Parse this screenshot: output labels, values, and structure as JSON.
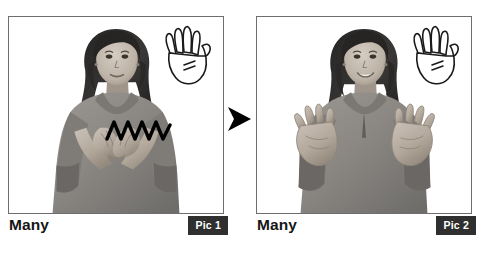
{
  "figure": {
    "type": "sign-language-instruction",
    "sign_word": "Many",
    "background_color": "#ffffff",
    "panel_border_color": "#6e6e6e",
    "badge_background_color": "#2f2f2f",
    "badge_text_color": "#ffffff",
    "caption_text_color": "#161616",
    "arrow_color": "#000000",
    "motion_line_color": "#000000"
  },
  "panels": [
    {
      "id": "pic-1",
      "caption": "Many",
      "badge_label": "Pic 1",
      "photo_alt": "Woman in gray sweater with both hands closed together in front of chest, palms up",
      "hand_diagram_alt": "Line drawing of an open hand with five fingers spread and motion marks",
      "motion_indicator": "zigzag",
      "stage": "start"
    },
    {
      "id": "pic-2",
      "caption": "Many",
      "badge_label": "Pic 2",
      "photo_alt": "Woman in gray sweater with both hands open, fingers spread, moved apart to the sides",
      "hand_diagram_alt": "Line drawing of an open hand with five fingers spread and motion marks",
      "motion_indicator": "none",
      "stage": "end"
    }
  ],
  "transition": {
    "icon": "right-arrow-icon",
    "direction": "right",
    "meaning": "then"
  }
}
